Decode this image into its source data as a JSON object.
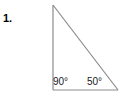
{
  "problem": {
    "number_label": "1."
  },
  "figure": {
    "type": "right-triangle",
    "stroke_color": "#8c8c8c",
    "stroke_width": 1,
    "background_color": "#ffffff",
    "text_color": "#1a1a1a",
    "vertices": {
      "apex": {
        "x": 53,
        "y": 5,
        "name": "A"
      },
      "bottom_left": {
        "x": 53,
        "y": 90,
        "name": "B"
      },
      "bottom_right": {
        "x": 118,
        "y": 90,
        "name": "C"
      }
    },
    "angles": [
      {
        "at_vertex": "bottom_left",
        "value": "90",
        "unit": "°",
        "text": "90°"
      },
      {
        "at_vertex": "bottom_right",
        "value": "50",
        "unit": "°",
        "text": "50°"
      }
    ],
    "sides": [
      {
        "name": "vertical-leg",
        "from": "apex",
        "to": "bottom_left"
      },
      {
        "name": "horizontal-leg",
        "from": "bottom_left",
        "to": "bottom_right"
      },
      {
        "name": "hypotenuse",
        "from": "apex",
        "to": "bottom_right"
      }
    ]
  }
}
